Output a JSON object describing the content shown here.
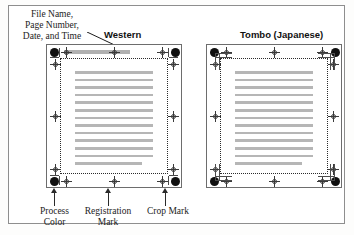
{
  "figure": {
    "callout_top_left": {
      "lines": [
        "File Name,",
        "Page Number,",
        "Date, and Time"
      ]
    },
    "panels": [
      {
        "id": "western",
        "title": "Western",
        "mark_style": "western",
        "text_line_count": 13,
        "has_filename_bar": true
      },
      {
        "id": "tombo",
        "title": "Tombo (Japanese)",
        "mark_style": "tombo",
        "text_line_count": 13,
        "has_filename_bar": false
      }
    ],
    "bottom_callouts": [
      {
        "id": "process-color",
        "lines": [
          "Process",
          "Color"
        ]
      },
      {
        "id": "registration-mark",
        "lines": [
          "Registration",
          "Mark"
        ]
      },
      {
        "id": "crop-mark",
        "lines": [
          "Crop Mark"
        ]
      }
    ],
    "colors": {
      "process_color_dot": "#101010",
      "registration_mark": "#3a3a3a",
      "crop_mark": "#4a4a4a",
      "text_line": "#b6b6b6",
      "filename_bar": "#b0b0b0",
      "frame": "#6d6d6d"
    }
  }
}
